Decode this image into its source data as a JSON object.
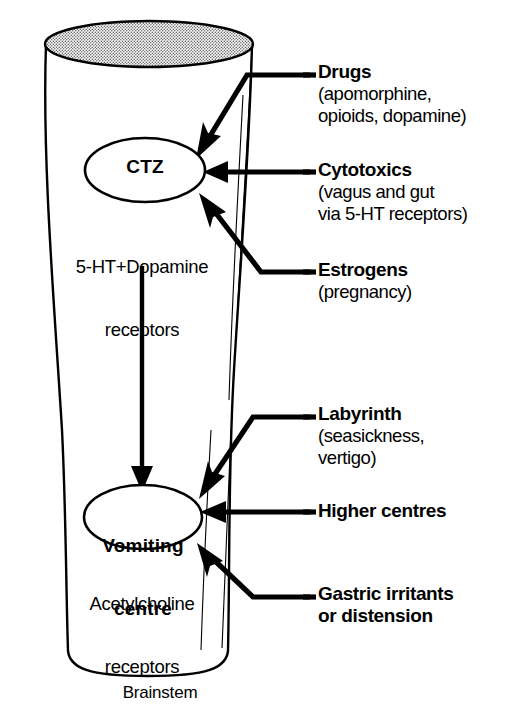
{
  "figure": {
    "background_color": "#ffffff",
    "ink_color": "#000000"
  },
  "brainstem": {
    "name": "Brainstem",
    "top_surface_fill": "stippled-grey"
  },
  "nodes": [
    {
      "id": "ctz",
      "label": "CTZ",
      "receptors": "5-HT+Dopamine\nreceptors",
      "receptors_line1": "5-HT+Dopamine",
      "receptors_line2": "receptors"
    },
    {
      "id": "vomiting-centre",
      "label": "Vomiting\ncentre",
      "label_line1": "Vomiting",
      "label_line2": "centre",
      "receptors": "Acetylcholine\nreceptors",
      "receptors_line1": "Acetylcholine",
      "receptors_line2": "receptors"
    }
  ],
  "callouts": [
    {
      "id": "drugs",
      "head": "Drugs",
      "sub_lines": [
        "(apomorphine,",
        "opioids, dopamine)"
      ],
      "target": "ctz"
    },
    {
      "id": "cytotoxics",
      "head": "Cytotoxics",
      "sub_lines": [
        "(vagus and gut",
        "via 5-HT receptors)"
      ],
      "target": "ctz"
    },
    {
      "id": "estrogens",
      "head": "Estrogens",
      "sub_lines": [
        "(pregnancy)"
      ],
      "target": "ctz"
    },
    {
      "id": "labyrinth",
      "head": "Labyrinth",
      "sub_lines": [
        "(seasickness,",
        "vertigo)"
      ],
      "target": "vomiting-centre"
    },
    {
      "id": "higher-centres",
      "head": "Higher centres",
      "sub_lines": [],
      "target": "vomiting-centre"
    },
    {
      "id": "gastric",
      "head": "Gastric irritants\nor distension",
      "head_line1": "Gastric irritants",
      "head_line2": "or distension",
      "sub_lines": [],
      "target": "vomiting-centre"
    }
  ],
  "connections": [
    {
      "from": "ctz",
      "to": "vomiting-centre",
      "style": "vertical-arrow"
    }
  ]
}
